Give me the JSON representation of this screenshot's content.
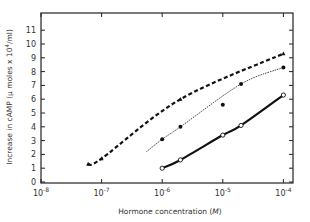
{
  "chart_data": {
    "type": "line",
    "title": "",
    "xlabel": "Hormone concentration (M)",
    "ylabel": "Increase in cAMP (μ moles x 10^4/ml)",
    "xscale": "log",
    "xlim": [
      1e-08,
      0.00012
    ],
    "ylim": [
      0,
      12
    ],
    "x_tick_labels": [
      "10^-8",
      "10^-7",
      "10^-6",
      "10^-5",
      "10^-4"
    ],
    "y_tick_labels": [
      "0",
      "1",
      "2",
      "3",
      "4",
      "5",
      "6",
      "7",
      "8",
      "9",
      "10",
      "11"
    ],
    "grid": false,
    "legend": null,
    "series": [
      {
        "name": "triangles (dashed line)",
        "marker": "triangle",
        "line_style": "dashed",
        "points": [
          [
            6e-08,
            1.3
          ],
          [
            1e-07,
            1.7
          ],
          [
            2e-06,
            6.0
          ],
          [
            0.0001,
            9.3
          ]
        ]
      },
      {
        "name": "filled circles (dotted line)",
        "marker": "filled-circle",
        "line_style": "dotted",
        "points": [
          [
            1e-06,
            3.1
          ],
          [
            2e-06,
            4.0
          ],
          [
            1e-05,
            5.6
          ],
          [
            2e-05,
            7.1
          ],
          [
            0.0001,
            8.3
          ]
        ]
      },
      {
        "name": "open circles (solid line)",
        "marker": "open-circle",
        "line_style": "solid",
        "points": [
          [
            1e-06,
            1.0
          ],
          [
            2e-06,
            1.6
          ],
          [
            1e-05,
            3.4
          ],
          [
            2e-05,
            4.1
          ],
          [
            0.0001,
            6.3
          ]
        ]
      }
    ]
  },
  "labels": {
    "xlabel": "Hormone concentration (",
    "xlabel_unit": "M",
    "xlabel_end": ")",
    "ylabel": "Increase in cAMP (μ moles x 10",
    "ylabel_exp": "4",
    "ylabel_end": "/ml)"
  }
}
